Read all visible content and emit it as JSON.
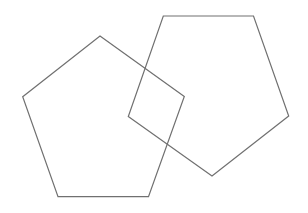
{
  "canvas": {
    "width": 308,
    "height": 213,
    "background": "#ffffff"
  },
  "style": {
    "stroke": "#707070",
    "stroke_width": 1.2,
    "fill": "none"
  },
  "shapes": [
    {
      "name": "left-pentagon",
      "points": "100,36 184.3,96.5 148.5,196.7 58,196.7 22.7,96.7"
    },
    {
      "name": "right-pentagon",
      "points": "163.3,16 253.5,16 288.7,116 212,176 128.3,116.5"
    }
  ]
}
